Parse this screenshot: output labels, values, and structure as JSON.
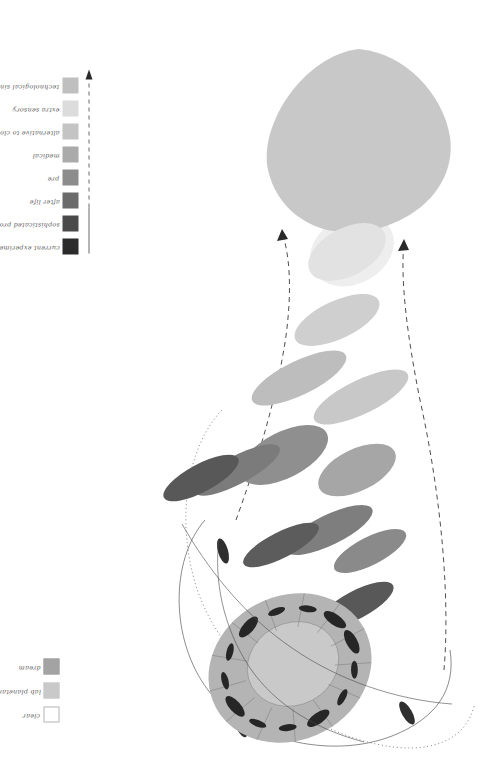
{
  "figure": {
    "title": "",
    "orientation": "rotated-90-ccw",
    "background": "#ffffff"
  },
  "gradient_legend": {
    "name": "maturity-gradient-legend",
    "axis_arrow": "solid-to-dashed-arrow-right",
    "items": [
      {
        "label": "current experiments",
        "color": "#2b2b2b"
      },
      {
        "label": "sophisticated products",
        "color": "#4a4a4a"
      },
      {
        "label": "after life",
        "color": "#6b6b6b"
      },
      {
        "label": "pre",
        "color": "#8c8c8c"
      },
      {
        "label": "medical",
        "color": "#aaaaaa"
      },
      {
        "label": "alternative to cloning",
        "color": "#c4c4c4"
      },
      {
        "label": "extra sensory",
        "color": "#dcdcdc"
      },
      {
        "label": "technological singularity",
        "color": "#bfbfbf"
      }
    ]
  },
  "category_legend": {
    "name": "category-legend",
    "items": [
      {
        "label": "clear",
        "color": "#ffffff",
        "border": "#b4b4b4"
      },
      {
        "label": "lab planetary and spheroidics",
        "color": "#c9c9c9",
        "border": "#c9c9c9"
      },
      {
        "label": "dream",
        "color": "#a3a3a3",
        "border": "#a3a3a3"
      }
    ]
  },
  "chart_data": {
    "type": "scatter",
    "title": "",
    "xlabel": "",
    "ylabel": "",
    "grid": false,
    "legend_position": "left",
    "annotations": [
      "dashed funnel converging on large blob",
      "thin solid and dotted enclosing contours"
    ],
    "blob": {
      "name": "technological-singularity-blob",
      "color": "#c8c8c8",
      "cx": 359,
      "cy": 140,
      "rx": 93,
      "ry": 90
    },
    "annulus": {
      "name": "lab-planetary-spheroidics-annulus",
      "ring_color": "#b0b0b0",
      "core_color": "#c9c9c9",
      "cx": 290,
      "cy": 668,
      "rx": 84,
      "ry": 72,
      "inner_rx": 47,
      "inner_ry": 40,
      "spoke_count": 13
    },
    "ellipses": [
      {
        "cx": 347,
        "cy": 252,
        "rx": 42,
        "ry": 24,
        "angle": -28,
        "color": "#e2e2e2"
      },
      {
        "cx": 337,
        "cy": 320,
        "rx": 46,
        "ry": 19,
        "angle": -25,
        "color": "#cfcfcf"
      },
      {
        "cx": 299,
        "cy": 378,
        "rx": 52,
        "ry": 17,
        "angle": -26,
        "color": "#bdbdbd"
      },
      {
        "cx": 361,
        "cy": 397,
        "rx": 52,
        "ry": 17,
        "angle": -26,
        "color": "#c8c8c8"
      },
      {
        "cx": 284,
        "cy": 455,
        "rx": 48,
        "ry": 23,
        "angle": -27,
        "color": "#8f8f8f"
      },
      {
        "cx": 237,
        "cy": 470,
        "rx": 48,
        "ry": 14,
        "angle": -28,
        "color": "#7b7b7b"
      },
      {
        "cx": 201,
        "cy": 478,
        "rx": 42,
        "ry": 14,
        "angle": -28,
        "color": "#585858"
      },
      {
        "cx": 357,
        "cy": 470,
        "rx": 42,
        "ry": 21,
        "angle": -26,
        "color": "#a6a6a6"
      },
      {
        "cx": 329,
        "cy": 530,
        "rx": 48,
        "ry": 15,
        "angle": -26,
        "color": "#7e7e7e"
      },
      {
        "cx": 281,
        "cy": 545,
        "rx": 42,
        "ry": 13,
        "angle": -27,
        "color": "#5c5c5c"
      },
      {
        "cx": 370,
        "cy": 551,
        "rx": 40,
        "ry": 14,
        "angle": -27,
        "color": "#8a8a8a"
      },
      {
        "cx": 356,
        "cy": 605,
        "rx": 42,
        "ry": 14,
        "angle": -28,
        "color": "#585858"
      },
      {
        "cx": 223,
        "cy": 551,
        "rx": 5,
        "ry": 13,
        "angle": -16,
        "color": "#2f2f2f"
      },
      {
        "cx": 407,
        "cy": 713,
        "rx": 5,
        "ry": 13,
        "angle": -30,
        "color": "#2f2f2f"
      },
      {
        "cx": 241,
        "cy": 726,
        "rx": 5,
        "ry": 12,
        "angle": -24,
        "color": "#2f2f2f"
      }
    ]
  }
}
